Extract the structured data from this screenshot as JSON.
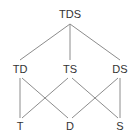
{
  "diagram": {
    "type": "hasse-lattice-diagram",
    "edge_color": "#8c8c8c",
    "label_color": "#333333",
    "background_color": "#ffffff",
    "nodes": [
      {
        "id": "TDS",
        "label": "TDS",
        "x": 70,
        "y": 14,
        "level": 0
      },
      {
        "id": "TD",
        "label": "TD",
        "x": 20,
        "y": 69,
        "level": 1
      },
      {
        "id": "TS",
        "label": "TS",
        "x": 70,
        "y": 69,
        "level": 1
      },
      {
        "id": "DS",
        "label": "DS",
        "x": 120,
        "y": 69,
        "level": 1
      },
      {
        "id": "T",
        "label": "T",
        "x": 20,
        "y": 126,
        "level": 2
      },
      {
        "id": "D",
        "label": "D",
        "x": 70,
        "y": 126,
        "level": 2
      },
      {
        "id": "S",
        "label": "S",
        "x": 120,
        "y": 126,
        "level": 2
      }
    ],
    "edges": [
      {
        "from": "TDS",
        "to": "TD",
        "x1": 70,
        "y1": 24,
        "x2": 20,
        "y2": 60
      },
      {
        "from": "TDS",
        "to": "TS",
        "x1": 70,
        "y1": 24,
        "x2": 70,
        "y2": 60
      },
      {
        "from": "TDS",
        "to": "DS",
        "x1": 70,
        "y1": 24,
        "x2": 120,
        "y2": 60
      },
      {
        "from": "TD",
        "to": "T",
        "x1": 20,
        "y1": 78,
        "x2": 20,
        "y2": 118
      },
      {
        "from": "TD",
        "to": "D",
        "x1": 22,
        "y1": 78,
        "x2": 68,
        "y2": 118
      },
      {
        "from": "TS",
        "to": "T",
        "x1": 68,
        "y1": 78,
        "x2": 22,
        "y2": 118
      },
      {
        "from": "TS",
        "to": "S",
        "x1": 72,
        "y1": 78,
        "x2": 118,
        "y2": 118
      },
      {
        "from": "DS",
        "to": "D",
        "x1": 118,
        "y1": 78,
        "x2": 72,
        "y2": 118
      },
      {
        "from": "DS",
        "to": "S",
        "x1": 120,
        "y1": 78,
        "x2": 120,
        "y2": 118
      }
    ],
    "crossings": [
      {
        "x": 37,
        "y": 100
      },
      {
        "x": 102,
        "y": 100
      }
    ]
  }
}
